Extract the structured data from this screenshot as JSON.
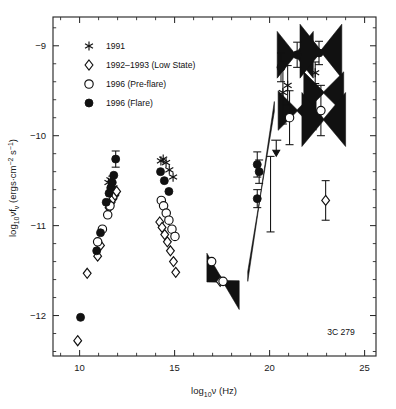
{
  "figure": {
    "annotation": "3C 279",
    "xaxis": {
      "label": "log",
      "label_sub": "10",
      "label_rest": "ν (Hz)",
      "ticks": [
        "10",
        "15",
        "20",
        "25"
      ],
      "tick_values": [
        10,
        15,
        20,
        25
      ],
      "range": [
        8.6,
        25.6
      ],
      "minor_step": 1
    },
    "yaxis": {
      "label_a": "log",
      "label_sub": "10",
      "label_b": "νf",
      "label_sub2": "ν",
      "label_c": " (ergs·cm",
      "label_sup": "−2",
      "label_d": " s",
      "label_sup2": "−1",
      "label_e": ")",
      "ticks": [
        "−9",
        "−10",
        "−11",
        "−12"
      ],
      "tick_values": [
        -9,
        -10,
        -11,
        -12
      ],
      "range": [
        -12.45,
        -8.68
      ],
      "minor_step": 0.2
    },
    "legend": {
      "items": [
        {
          "label": "1991",
          "symbol": "asterisk"
        },
        {
          "label": "1992–1993 (Low State)",
          "symbol": "open-diamond"
        },
        {
          "label": "1996 (Pre-flare)",
          "symbol": "open-circle"
        },
        {
          "label": "1996 (Flare)",
          "symbol": "filled-circle"
        }
      ]
    }
  },
  "chart_data": {
    "type": "scatter",
    "title": "",
    "subtitle": "",
    "xlabel": "log10 nu (Hz)",
    "ylabel": "log10 nu*f_nu (ergs cm^-2 s^-1)",
    "xlim": [
      8.6,
      25.6
    ],
    "ylim": [
      -12.45,
      -8.68
    ],
    "grid": false,
    "legend_position": "top-left",
    "annotations": [
      {
        "text": "3C 279",
        "x": 23.2,
        "y": -11.85
      }
    ],
    "series": [
      {
        "name": "1991",
        "symbol": "asterisk",
        "points": [
          {
            "x": 11.52,
            "y": -10.52
          },
          {
            "x": 11.62,
            "y": -10.49
          },
          {
            "x": 11.7,
            "y": -10.55
          },
          {
            "x": 11.78,
            "y": -10.58
          },
          {
            "x": 11.86,
            "y": -10.63
          },
          {
            "x": 14.28,
            "y": -10.28
          },
          {
            "x": 14.4,
            "y": -10.26
          },
          {
            "x": 14.55,
            "y": -10.3
          },
          {
            "x": 14.72,
            "y": -10.38
          },
          {
            "x": 14.92,
            "y": -10.46
          },
          {
            "x": 20.95,
            "y": -9.44
          },
          {
            "x": 22.4,
            "y": -9.3
          },
          {
            "x": 20.7,
            "y": -9.52
          }
        ]
      },
      {
        "name": "1992–1993 (Low State)",
        "symbol": "open-diamond",
        "points": [
          {
            "x": 9.9,
            "y": -12.28
          },
          {
            "x": 10.4,
            "y": -11.53
          },
          {
            "x": 10.95,
            "y": -11.34
          },
          {
            "x": 11.1,
            "y": -11.22
          },
          {
            "x": 11.55,
            "y": -10.8
          },
          {
            "x": 11.66,
            "y": -10.74
          },
          {
            "x": 11.76,
            "y": -10.7
          },
          {
            "x": 11.86,
            "y": -10.66
          },
          {
            "x": 11.95,
            "y": -10.62
          },
          {
            "x": 14.22,
            "y": -10.96
          },
          {
            "x": 14.34,
            "y": -11.02
          },
          {
            "x": 14.48,
            "y": -11.1
          },
          {
            "x": 14.62,
            "y": -11.18
          },
          {
            "x": 14.78,
            "y": -11.28
          },
          {
            "x": 14.94,
            "y": -11.4
          },
          {
            "x": 15.06,
            "y": -11.52
          },
          {
            "x": 17.4,
            "y": -11.62
          },
          {
            "x": 22.95,
            "y": -10.72
          }
        ]
      },
      {
        "name": "1996 (Pre-flare)",
        "symbol": "open-circle",
        "points": [
          {
            "x": 10.95,
            "y": -11.18
          },
          {
            "x": 11.2,
            "y": -11.04
          },
          {
            "x": 11.48,
            "y": -10.88
          },
          {
            "x": 11.6,
            "y": -10.78
          },
          {
            "x": 14.3,
            "y": -10.72
          },
          {
            "x": 14.42,
            "y": -10.78
          },
          {
            "x": 14.56,
            "y": -10.86
          },
          {
            "x": 14.7,
            "y": -10.94
          },
          {
            "x": 14.86,
            "y": -11.04
          },
          {
            "x": 15.02,
            "y": -11.12
          },
          {
            "x": 16.95,
            "y": -11.4
          },
          {
            "x": 17.55,
            "y": -11.62
          },
          {
            "x": 21.05,
            "y": -9.8
          },
          {
            "x": 22.7,
            "y": -9.72
          }
        ]
      },
      {
        "name": "1996 (Flare)",
        "symbol": "filled-circle",
        "points": [
          {
            "x": 10.05,
            "y": -12.02
          },
          {
            "x": 10.9,
            "y": -11.28
          },
          {
            "x": 11.1,
            "y": -11.08
          },
          {
            "x": 11.4,
            "y": -10.74
          },
          {
            "x": 11.55,
            "y": -10.64
          },
          {
            "x": 11.64,
            "y": -10.58
          },
          {
            "x": 11.72,
            "y": -10.52
          },
          {
            "x": 11.8,
            "y": -10.44
          },
          {
            "x": 11.9,
            "y": -10.26
          },
          {
            "x": 14.26,
            "y": -10.4
          },
          {
            "x": 14.46,
            "y": -10.5
          },
          {
            "x": 14.7,
            "y": -10.62
          },
          {
            "x": 19.35,
            "y": -10.32
          },
          {
            "x": 19.45,
            "y": -10.4
          },
          {
            "x": 19.35,
            "y": -10.7
          },
          {
            "x": 20.6,
            "y": -9.24
          },
          {
            "x": 21.45,
            "y": -9.1
          },
          {
            "x": 22.6,
            "y": -9.08
          }
        ]
      }
    ],
    "error_bars": [
      {
        "x": 11.9,
        "y": -10.26,
        "yerr": 0.09
      },
      {
        "x": 11.72,
        "y": -10.52,
        "yerr": 0.07
      },
      {
        "x": 19.35,
        "y": -10.32,
        "yerr": 0.14
      },
      {
        "x": 19.45,
        "y": -10.4,
        "yerr": 0.13
      },
      {
        "x": 19.35,
        "y": -10.7,
        "yerr": 0.1
      },
      {
        "x": 20.05,
        "y": -10.65,
        "yerr": 0.42
      },
      {
        "x": 20.6,
        "y": -9.24,
        "yerr": 0.16
      },
      {
        "x": 21.45,
        "y": -9.1,
        "yerr": 0.14
      },
      {
        "x": 22.6,
        "y": -9.08,
        "yerr": 0.13
      },
      {
        "x": 21.05,
        "y": -9.8,
        "yerr": 0.3
      },
      {
        "x": 20.7,
        "y": -9.52,
        "yerr": 0.35
      },
      {
        "x": 20.95,
        "y": -9.44,
        "yerr": 0.22
      },
      {
        "x": 22.7,
        "y": -9.72,
        "yerr": 0.28
      },
      {
        "x": 22.4,
        "y": -9.3,
        "yerr": 0.12
      },
      {
        "x": 22.95,
        "y": -10.72,
        "yerr": 0.22
      }
    ],
    "upper_limits": [
      {
        "x": 20.35,
        "y": -10.05
      }
    ],
    "bowties": [
      {
        "name": "x-ray-flare-bowtie",
        "x": 19.55,
        "y": -10.62,
        "xhalf": 0.7,
        "slope": 1.35,
        "thick": 0.055
      },
      {
        "name": "x-ray-lowstate-bowtie",
        "x": 17.55,
        "y": -11.62,
        "xhalf": 0.85,
        "slope": -0.18,
        "thick": 0.16
      },
      {
        "name": "gamma-bowtie-1",
        "x": 21.35,
        "y": -9.1,
        "xhalf": 0.95,
        "slope": 0.0,
        "thick": 0.26
      },
      {
        "name": "gamma-bowtie-2",
        "x": 22.7,
        "y": -9.06,
        "xhalf": 1.1,
        "slope": 0.0,
        "thick": 0.3
      },
      {
        "name": "gamma-bowtie-3",
        "x": 21.45,
        "y": -9.72,
        "xhalf": 1.0,
        "slope": 0.0,
        "thick": 0.22
      },
      {
        "name": "gamma-bowtie-4",
        "x": 22.85,
        "y": -9.52,
        "xhalf": 1.05,
        "slope": 0.0,
        "thick": 0.23
      },
      {
        "name": "gamma-bowtie-5",
        "x": 22.85,
        "y": -9.82,
        "xhalf": 1.15,
        "slope": 0.0,
        "thick": 0.3
      }
    ]
  }
}
